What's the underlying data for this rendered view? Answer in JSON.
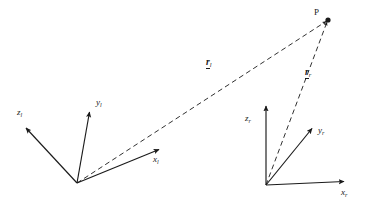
{
  "figure": {
    "background_color": "#ffffff",
    "stroke_color": "#1a1a1a",
    "width": 370,
    "height": 218
  },
  "point": {
    "label": "P",
    "x": 328,
    "y": 20
  },
  "frames": [
    {
      "name": "left-frame",
      "subscript": "l",
      "origin": {
        "x": 77,
        "y": 183
      },
      "axes": [
        {
          "name": "z-axis",
          "symbol": "z",
          "subscript": "l",
          "tip": {
            "x": 25,
            "y": 127
          },
          "label_x": 17,
          "label_y": 112
        },
        {
          "name": "y-axis",
          "symbol": "y",
          "subscript": "l",
          "tip": {
            "x": 89,
            "y": 110
          },
          "label_x": 95,
          "label_y": 100
        },
        {
          "name": "x-axis",
          "symbol": "x",
          "subscript": "l",
          "tip": {
            "x": 160,
            "y": 149
          },
          "label_x": 152,
          "label_y": 158
        }
      ]
    },
    {
      "name": "right-frame",
      "subscript": "r",
      "origin": {
        "x": 266,
        "y": 185
      },
      "axes": [
        {
          "name": "z-axis",
          "symbol": "z",
          "subscript": "r",
          "tip": {
            "x": 266,
            "y": 105
          },
          "label_x": 246,
          "label_y": 117
        },
        {
          "name": "y-axis",
          "symbol": "y",
          "subscript": "r",
          "tip": {
            "x": 313,
            "y": 127
          },
          "label_x": 318,
          "label_y": 128
        },
        {
          "name": "x-axis",
          "symbol": "x",
          "subscript": "r",
          "tip": {
            "x": 345,
            "y": 182
          },
          "label_x": 340,
          "label_y": 190
        }
      ]
    }
  ],
  "vectors": [
    {
      "name": "r-left",
      "symbol": "r",
      "subscript": "l",
      "from": {
        "x": 77,
        "y": 183
      },
      "to": {
        "x": 328,
        "y": 20
      },
      "style": "dashed",
      "label_x": 206,
      "label_y": 62
    },
    {
      "name": "r-right",
      "symbol": "r",
      "subscript": "r",
      "from": {
        "x": 266,
        "y": 185
      },
      "to": {
        "x": 328,
        "y": 20
      },
      "style": "dashed",
      "label_x": 305,
      "label_y": 72
    }
  ]
}
